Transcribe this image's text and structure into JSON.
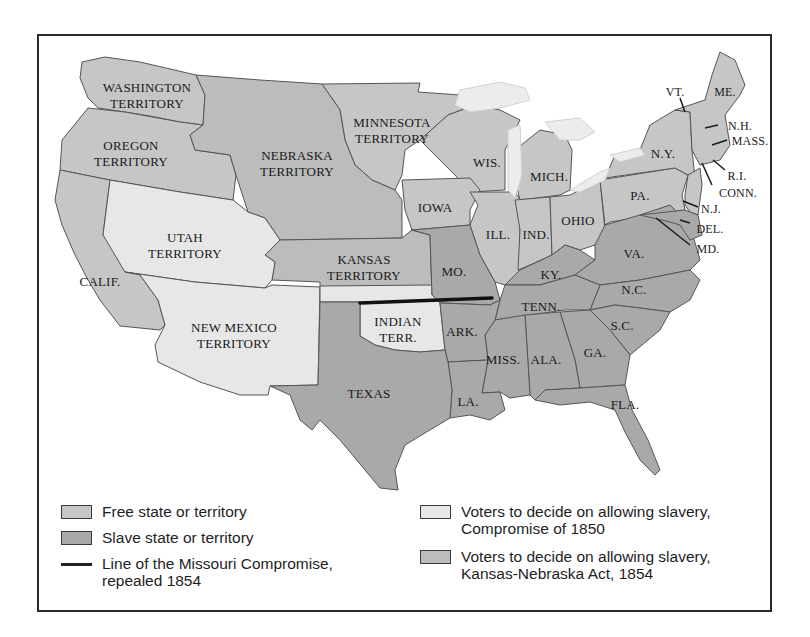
{
  "map": {
    "title": "",
    "colors": {
      "free": "#c6c6c6",
      "slave": "#a9a9a9",
      "compromise_1850": "#e7e7e7",
      "kansas_nebraska": "#bcbcbc",
      "missouri_line": "#111111",
      "border": "#2a2a2a"
    },
    "regions": {
      "washington": "WASHINGTON",
      "washington2": "TERRITORY",
      "oregon": "OREGON",
      "oregon2": "TERRITORY",
      "nebraska": "NEBRASKA",
      "nebraska2": "TERRITORY",
      "minnesota": "MINNESOTA",
      "minnesota2": "TERRITORY",
      "utah": "UTAH",
      "utah2": "TERRITORY",
      "kansas": "KANSAS",
      "kansas2": "TERRITORY",
      "newmexico": "NEW MEXICO",
      "newmexico2": "TERRITORY",
      "indian": "INDIAN",
      "indian2": "TERR.",
      "calif": "CALIF.",
      "texas": "TEXAS",
      "iowa": "IOWA",
      "wis": "WIS.",
      "mich": "MICH.",
      "ill": "ILL.",
      "ind": "IND.",
      "ohio": "OHIO",
      "mo": "MO.",
      "ky": "KY.",
      "tenn": "TENN.",
      "ark": "ARK.",
      "la": "LA.",
      "miss": "MISS.",
      "ala": "ALA.",
      "ga": "GA.",
      "fla": "FLA.",
      "sc": "S.C.",
      "nc": "N.C.",
      "va": "VA.",
      "pa": "PA.",
      "ny": "N.Y.",
      "vt": "VT.",
      "me": "ME.",
      "nh": "N.H.",
      "mass": "MASS.",
      "ri": "R.I.",
      "conn": "CONN.",
      "nj": "N.J.",
      "del": "DEL.",
      "md": "MD."
    }
  },
  "legend": {
    "items": [
      {
        "label": "Free state or territory",
        "type": "swatch",
        "color": "#c6c6c6"
      },
      {
        "label": "Slave state or territory",
        "type": "swatch",
        "color": "#a9a9a9"
      },
      {
        "label": "Line of the Missouri Compromise,",
        "label2": "repealed 1854",
        "type": "line",
        "color": "#111111"
      },
      {
        "label": "Voters to decide on allowing slavery,",
        "label2": "Compromise of 1850",
        "type": "swatch",
        "color": "#e7e7e7"
      },
      {
        "label": "Voters to decide on allowing slavery,",
        "label2": "Kansas-Nebraska Act, 1854",
        "type": "swatch",
        "color": "#bcbcbc"
      }
    ]
  }
}
